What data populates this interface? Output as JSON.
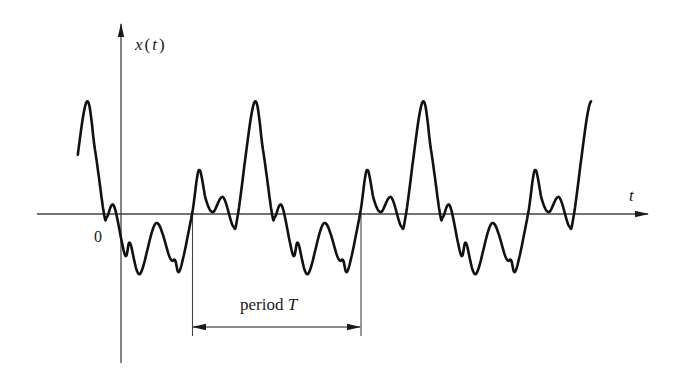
{
  "figure": {
    "y_axis_label": "x(t)",
    "y_axis_label_var": "x",
    "y_axis_label_arg": "t",
    "x_axis_label": "t",
    "origin_label": "0",
    "period_label_word": "period",
    "period_label_symbol": "T",
    "colors": {
      "ink": "#1a1a1a",
      "axis": "#444444",
      "background": "#ffffff"
    }
  },
  "chart_data": {
    "type": "line",
    "xlabel": "t",
    "ylabel": "x(t)",
    "period_px": 168,
    "origin_px": {
      "x": 121,
      "y": 214
    },
    "first_period_start_px": 192,
    "curve_start_px": 77,
    "curve_end_px": 591,
    "one_period_shape": {
      "note": "points relative to rising zero crossing; dy positive = below axis (pixels)",
      "points": [
        [
          0,
          0
        ],
        [
          7,
          -44
        ],
        [
          14,
          -14
        ],
        [
          21,
          -2
        ],
        [
          31,
          -17
        ],
        [
          41,
          12
        ],
        [
          46,
          0
        ],
        [
          62,
          -111
        ],
        [
          71,
          -64
        ],
        [
          80,
          0
        ],
        [
          83,
          3
        ],
        [
          90,
          -8
        ],
        [
          101,
          41
        ],
        [
          106,
          29
        ],
        [
          116,
          60
        ],
        [
          132,
          9
        ],
        [
          146,
          44
        ],
        [
          151,
          46
        ],
        [
          156,
          56
        ],
        [
          168,
          0
        ]
      ]
    },
    "axes": {
      "t_axis": {
        "x1": 37,
        "x2": 648,
        "y": 214
      },
      "x_axis_vertical": {
        "x": 121,
        "y1": 24,
        "y2": 363
      }
    },
    "period_annotation": {
      "x_start": 192,
      "x_end": 361,
      "arrow_y": 327,
      "guide_bottom": 336,
      "label": "period T"
    },
    "grid": false,
    "legend": null
  }
}
